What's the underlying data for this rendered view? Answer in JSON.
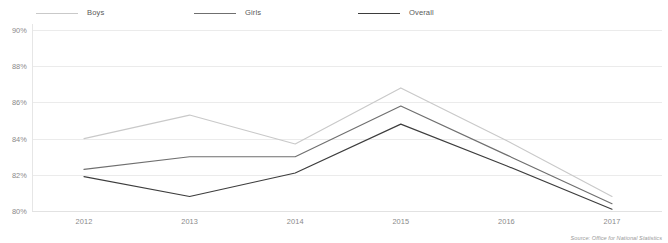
{
  "legend": {
    "items": [
      {
        "label": "Boys",
        "color": "#c9c9c9"
      },
      {
        "label": "Girls",
        "color": "#6f6f6f"
      },
      {
        "label": "Overall",
        "color": "#3d3d3d"
      }
    ]
  },
  "source": {
    "text": "Source: Office for National Statistics"
  },
  "axes": {
    "y_ticks": [
      "80%",
      "82%",
      "84%",
      "86%",
      "88%",
      "90%"
    ],
    "x_ticks": [
      "2012",
      "2013",
      "2014",
      "2015",
      "2016",
      "2017"
    ]
  },
  "chart_data": {
    "type": "line",
    "title": "",
    "subtitle": "",
    "xlabel": "",
    "ylabel": "",
    "categories": [
      "2012",
      "2013",
      "2014",
      "2015",
      "2016",
      "2017"
    ],
    "x": [
      2012,
      2013,
      2014,
      2015,
      2016,
      2017
    ],
    "series": [
      {
        "name": "Boys",
        "color": "#c9c9c9",
        "values": [
          84.0,
          85.3,
          83.7,
          86.8,
          83.9,
          80.8
        ]
      },
      {
        "name": "Girls",
        "color": "#6f6f6f",
        "values": [
          82.3,
          83.0,
          83.0,
          85.8,
          83.1,
          80.4
        ]
      },
      {
        "name": "Overall",
        "color": "#3d3d3d",
        "values": [
          81.9,
          80.8,
          82.1,
          84.8,
          82.5,
          80.1
        ]
      }
    ],
    "ylim": [
      80,
      90
    ],
    "ytick_values": [
      80,
      82,
      84,
      86,
      88,
      90
    ],
    "ytick_labels": [
      "80%",
      "82%",
      "84%",
      "86%",
      "88%",
      "90%"
    ],
    "grid": true,
    "grid_axis": "y",
    "legend_position": "top",
    "annotations": [
      "Source: Office for National Statistics"
    ]
  }
}
